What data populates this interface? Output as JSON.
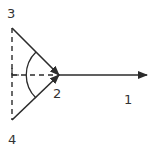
{
  "diagram": {
    "labels": {
      "p1": "1",
      "p2": "2",
      "p3": "3",
      "p4": "4"
    },
    "colors": {
      "stroke": "#2b2b2b",
      "text": "#333333",
      "background": "#ffffff"
    },
    "elements": [
      {
        "type": "arrow",
        "from": "3",
        "to": "2",
        "style": "solid"
      },
      {
        "type": "arrow",
        "from": "4",
        "to": "2",
        "style": "solid"
      },
      {
        "type": "arrow",
        "from": "2",
        "to": "1",
        "style": "solid"
      },
      {
        "type": "line",
        "from": "3",
        "to": "4",
        "style": "dashed"
      },
      {
        "type": "line",
        "from": "foot",
        "to": "2",
        "style": "dashed"
      },
      {
        "type": "arc",
        "center": "2",
        "style": "solid"
      }
    ]
  }
}
